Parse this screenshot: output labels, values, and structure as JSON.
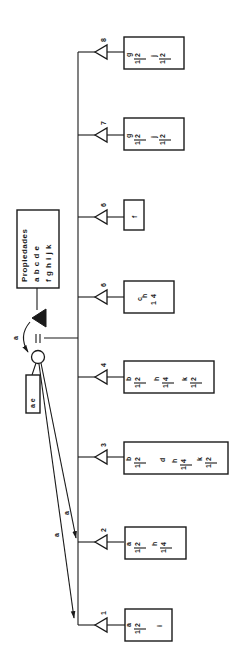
{
  "diagram": {
    "orientation": "rotated-90-ccw",
    "colors": {
      "ink": "#1a1a1a",
      "background": "#ffffff"
    },
    "properties_box": {
      "title": "Propiedades",
      "row1": "a b c d e",
      "row2": "f g h i j k"
    },
    "source_node": {
      "black_triangle_label": "a",
      "equals_symbol": "=",
      "circle": "node",
      "attached_box": "a e"
    },
    "arrow_labels": {
      "to_2": "a",
      "to_1": "a"
    },
    "branches": [
      {
        "number": "8",
        "terms": [
          {
            "coef": "1/2",
            "coef_num": "1",
            "coef_den": "2",
            "var": "g"
          },
          {
            "coef": "1/2",
            "coef_num": "1",
            "coef_den": "2",
            "var": "j"
          }
        ]
      },
      {
        "number": "7",
        "terms": [
          {
            "coef": "1/2",
            "coef_num": "1",
            "coef_den": "2",
            "var": "g"
          },
          {
            "coef": "1/2",
            "coef_num": "1",
            "coef_den": "2",
            "var": "j"
          }
        ]
      },
      {
        "number": "6",
        "terms": [
          {
            "coef": "",
            "var": "f"
          }
        ]
      },
      {
        "number": "5",
        "display_number": "6",
        "terms": [
          {
            "coef": "",
            "var": "c"
          },
          {
            "coef": "1/4",
            "coef_num": "1",
            "coef_den": "4",
            "var": "h"
          }
        ]
      },
      {
        "number": "4",
        "terms": [
          {
            "coef": "1/2",
            "coef_num": "1",
            "coef_den": "2",
            "var": "b"
          },
          {
            "coef": "1/4",
            "coef_num": "1",
            "coef_den": "4",
            "var": "h"
          },
          {
            "coef": "1/2",
            "coef_num": "1",
            "coef_den": "2",
            "var": "k"
          }
        ]
      },
      {
        "number": "3",
        "terms": [
          {
            "coef": "1/2",
            "coef_num": "1",
            "coef_den": "2",
            "var": "b"
          },
          {
            "coef": "",
            "var": "d"
          },
          {
            "coef": "1/4",
            "coef_num": "1",
            "coef_den": "4",
            "var": "h"
          },
          {
            "coef": "1/2",
            "coef_num": "1",
            "coef_den": "2",
            "var": "k"
          }
        ]
      },
      {
        "number": "2",
        "terms": [
          {
            "coef": "1/2",
            "coef_num": "1",
            "coef_den": "2",
            "var": "a"
          },
          {
            "coef": "1/4",
            "coef_num": "1",
            "coef_den": "4",
            "var": "h"
          }
        ]
      },
      {
        "number": "1",
        "terms": [
          {
            "coef": "1/2",
            "coef_num": "1",
            "coef_den": "2",
            "var": "a"
          },
          {
            "coef": "",
            "var": "i"
          }
        ]
      }
    ]
  }
}
